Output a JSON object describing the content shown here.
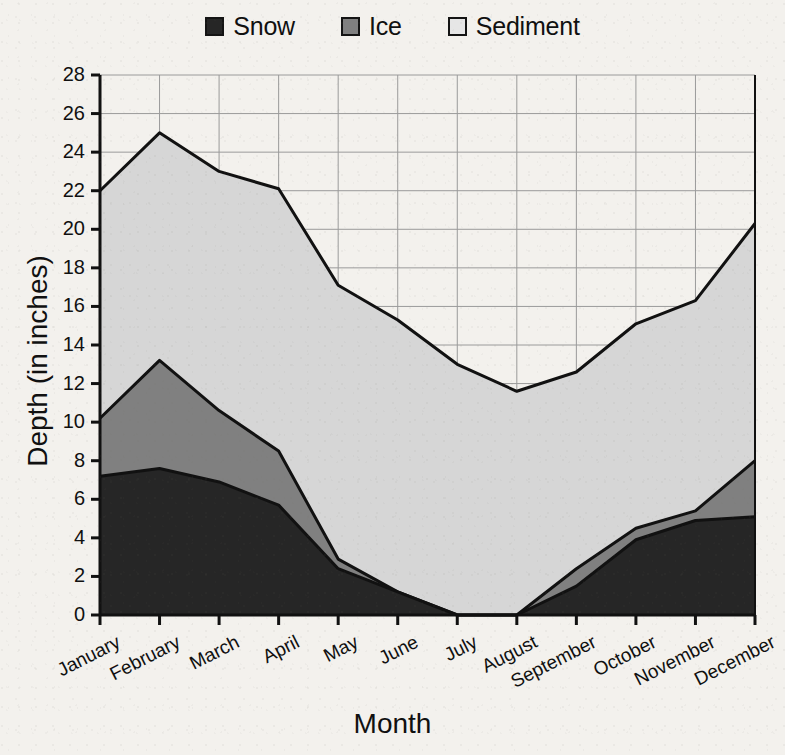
{
  "chart_data": {
    "type": "area",
    "stacked": true,
    "title": "",
    "xlabel": "Month",
    "ylabel": "Depth (in inches)",
    "categories": [
      "January",
      "February",
      "March",
      "April",
      "May",
      "June",
      "July",
      "August",
      "September",
      "October",
      "November",
      "December"
    ],
    "series": [
      {
        "name": "Snow",
        "color": "#262626",
        "values": [
          7.2,
          7.6,
          6.9,
          5.7,
          2.4,
          1.2,
          0.0,
          0.0,
          1.5,
          3.9,
          4.9,
          5.1
        ]
      },
      {
        "name": "Ice",
        "color": "#808080",
        "values": [
          3.0,
          5.6,
          3.7,
          2.8,
          0.5,
          0.0,
          0.0,
          0.0,
          0.9,
          0.6,
          0.5,
          2.9
        ]
      },
      {
        "name": "Sediment",
        "color": "#d6d6d6",
        "values": [
          11.8,
          11.8,
          12.4,
          13.6,
          14.2,
          14.1,
          13.0,
          11.6,
          10.2,
          10.6,
          10.9,
          12.3
        ]
      }
    ],
    "cumulative_tops": {
      "snow": [
        7.2,
        7.6,
        6.9,
        5.7,
        2.4,
        1.2,
        0.0,
        0.0,
        1.5,
        3.9,
        4.9,
        5.1
      ],
      "ice": [
        10.2,
        13.2,
        10.6,
        8.5,
        2.9,
        1.2,
        0.0,
        0.0,
        2.4,
        4.5,
        5.4,
        8.0
      ],
      "sediment": [
        22.0,
        25.0,
        23.0,
        22.1,
        17.1,
        15.3,
        13.0,
        11.6,
        12.6,
        15.1,
        16.3,
        20.3
      ]
    },
    "ylim": [
      0,
      28
    ],
    "ytick_step": 2,
    "yticks": [
      0,
      2,
      4,
      6,
      8,
      10,
      12,
      14,
      16,
      18,
      20,
      22,
      24,
      26,
      28
    ],
    "grid": true,
    "legend_position": "top-center",
    "legend": [
      {
        "label": "Snow",
        "swatch_color": "#262626"
      },
      {
        "label": "Ice",
        "swatch_color": "#808080"
      },
      {
        "label": "Sediment",
        "swatch_color": "#e2e2e2"
      }
    ]
  },
  "axes": {
    "y_title": "Depth (in inches)",
    "x_title": "Month"
  },
  "colors": {
    "background": "#f3f1ed",
    "outline": "#111111",
    "grid": "#9a9a9a",
    "snow": "#262626",
    "ice": "#808080",
    "sediment": "#d6d6d6"
  }
}
